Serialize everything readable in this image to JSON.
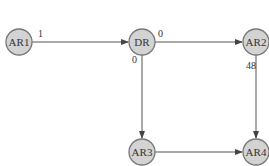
{
  "nodes": [
    {
      "id": "AR1",
      "label": "AR1",
      "x": 19,
      "y": 42
    },
    {
      "id": "DR",
      "label": "DR",
      "x": 142,
      "y": 42
    },
    {
      "id": "AR2",
      "label": "AR2",
      "x": 256,
      "y": 42
    },
    {
      "id": "AR3",
      "label": "AR3",
      "x": 142,
      "y": 152
    },
    {
      "id": "AR4",
      "label": "AR4",
      "x": 256,
      "y": 152
    }
  ],
  "edges": [
    {
      "from": "AR1",
      "to": "DR",
      "label": "1"
    },
    {
      "from": "DR",
      "to": "AR2",
      "label": "0"
    },
    {
      "from": "DR",
      "to": "AR3",
      "label": "0"
    },
    {
      "from": "AR2",
      "to": "AR4",
      "label": "48"
    },
    {
      "from": "AR3",
      "to": "AR4",
      "label": ""
    }
  ],
  "colors": {
    "node_fill": "#d3d3d3",
    "node_stroke": "#777777",
    "edge": "#555555"
  }
}
